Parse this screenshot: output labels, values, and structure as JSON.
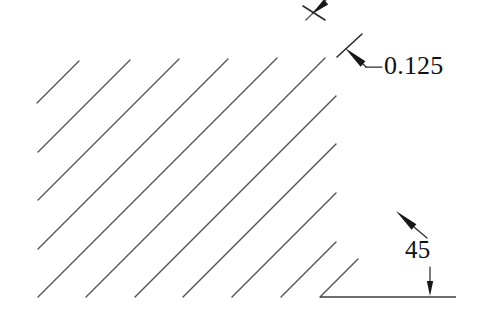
{
  "figure": {
    "kind": "engineering-hatching-detail",
    "background_color": "#ffffff",
    "line_color": "#55555d",
    "boundary_color": "#3d3d45",
    "annotation_color": "#17171a",
    "text_color": "#121214"
  },
  "annotations": {
    "spacing": {
      "label": "0.125",
      "name": "hatch-spacing-dimension",
      "text_x": 384,
      "text_y": 74,
      "leader": {
        "tick_x1": 337,
        "tick_y1": 57,
        "tick_x2": 362,
        "tick_y2": 34,
        "arrow_tip_x": 345,
        "arrow_tip_y": 48,
        "arrow_tail_x": 363,
        "arrow_tail_y": 64,
        "elbow_x": 366,
        "elbow_y": 67,
        "shelf_x1": 366,
        "shelf_y1": 67,
        "shelf_x2": 382,
        "shelf_y2": 67
      }
    },
    "angle": {
      "label": "45",
      "name": "hatch-angle-dimension",
      "text_x": 405,
      "text_y": 258,
      "upper_leader": {
        "arrow_tip_x": 396,
        "arrow_tip_y": 211,
        "arrow_tail_x": 414,
        "arrow_tail_y": 227,
        "tail_end_x": 427,
        "tail_end_y": 238
      },
      "lower_leader": {
        "arrow_tip_x": 430,
        "arrow_tip_y": 296,
        "arrow_tail_x": 430,
        "arrow_tail_y": 267
      }
    },
    "top_pointer": {
      "name": "top-hatch-pointer",
      "arrow_tip_x": 312,
      "arrow_tip_y": 14,
      "arrow_tail_x": 326,
      "arrow_tail_y": 2,
      "tick_x1": 303,
      "tick_y1": 6,
      "tick_x2": 325,
      "tick_y2": 20
    }
  },
  "geometry": {
    "baseline": {
      "name": "baseline-edge",
      "x1": 320,
      "y1": 297,
      "x2": 456,
      "y2": 297
    },
    "hatch_angle_deg": 45,
    "hatch_spacing_px": 48,
    "hatch_lines": [
      {
        "x1": 37,
        "y1": 103,
        "x2": 79,
        "y2": 61
      },
      {
        "x1": 38,
        "y1": 152,
        "x2": 130,
        "y2": 60
      },
      {
        "x1": 38,
        "y1": 200,
        "x2": 179,
        "y2": 59
      },
      {
        "x1": 38,
        "y1": 249,
        "x2": 228,
        "y2": 59
      },
      {
        "x1": 38,
        "y1": 297,
        "x2": 277,
        "y2": 58
      },
      {
        "x1": 86,
        "y1": 297,
        "x2": 325,
        "y2": 58
      },
      {
        "x1": 135,
        "y1": 297,
        "x2": 336,
        "y2": 96
      },
      {
        "x1": 183,
        "y1": 297,
        "x2": 336,
        "y2": 144
      },
      {
        "x1": 232,
        "y1": 297,
        "x2": 336,
        "y2": 193
      },
      {
        "x1": 281,
        "y1": 297,
        "x2": 336,
        "y2": 242
      },
      {
        "x1": 320,
        "y1": 297,
        "x2": 358,
        "y2": 259
      },
      {
        "x1": 306,
        "y1": 20,
        "x2": 345,
        "y2": -19
      }
    ]
  }
}
